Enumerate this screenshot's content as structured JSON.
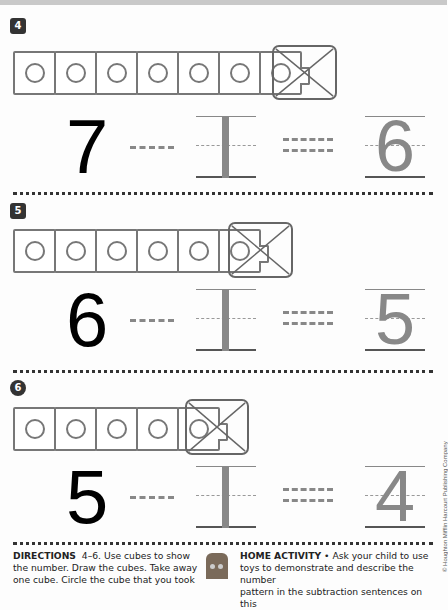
{
  "page": {
    "type": "math-worksheet",
    "topic": "subtraction number pattern"
  },
  "problems": [
    {
      "number": "4",
      "badge_shape": "star",
      "cubes_drawn": 7,
      "cube_taken_away": 1,
      "equation": {
        "minuend": "7",
        "operator": "−",
        "subtrahend": "1",
        "equals": "=",
        "difference": "6"
      }
    },
    {
      "number": "5",
      "badge_shape": "bear",
      "cubes_drawn": 6,
      "cube_taken_away": 1,
      "equation": {
        "minuend": "6",
        "operator": "−",
        "subtrahend": "1",
        "equals": "=",
        "difference": "5"
      }
    },
    {
      "number": "6",
      "badge_shape": "circle",
      "cubes_drawn": 5,
      "cube_taken_away": 1,
      "equation": {
        "minuend": "5",
        "operator": "−",
        "subtrahend": "1",
        "equals": "=",
        "difference": "4"
      }
    }
  ],
  "footer": {
    "directions_label": "DIRECTIONS",
    "directions_range": "4–6.",
    "directions_text_line1": "Use cubes to show",
    "directions_text_line2": "the number. Draw the cubes. Take away",
    "directions_text_line3": "one cube. Circle the cube that you took",
    "home_label": "HOME ACTIVITY",
    "home_bullet": "•",
    "home_text_line1": "Ask your child to use",
    "home_text_line2": "toys to demonstrate and describe the number",
    "home_text_line3": "pattern in the subtraction sentences on this"
  },
  "copyright": "© Houghton Mifflin Harcourt Publishing Company",
  "colors": {
    "cube_outline": "#777777",
    "trace_gray": "#888888",
    "ink": "#000000"
  }
}
